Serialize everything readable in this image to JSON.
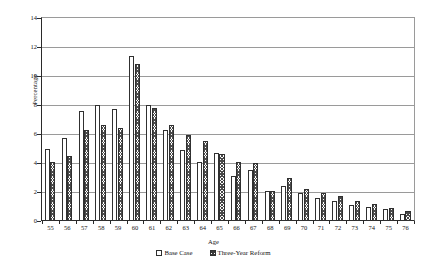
{
  "chart_data": {
    "type": "bar",
    "title": "",
    "xlabel": "Age",
    "ylabel": "Percentage",
    "ylim": [
      0,
      14
    ],
    "ytick_step": 2,
    "yticks": [
      0,
      2,
      4,
      6,
      8,
      10,
      12,
      14
    ],
    "grid": true,
    "legend_position": "bottom-center",
    "categories": [
      "55",
      "56",
      "57",
      "58",
      "59",
      "60",
      "61",
      "62",
      "63",
      "64",
      "65",
      "66",
      "67",
      "68",
      "69",
      "70",
      "71",
      "72",
      "73",
      "74",
      "75",
      "76"
    ],
    "series": [
      {
        "name": "Base Case",
        "values": [
          5.0,
          5.7,
          7.6,
          8.0,
          7.7,
          11.4,
          8.0,
          6.3,
          4.9,
          4.1,
          4.7,
          3.1,
          3.5,
          2.1,
          2.4,
          1.9,
          1.6,
          1.4,
          1.1,
          1.0,
          0.8,
          0.5
        ]
      },
      {
        "name": "Three-Year Reform",
        "values": [
          4.1,
          4.5,
          6.3,
          6.6,
          6.4,
          10.8,
          7.8,
          6.6,
          5.9,
          5.5,
          4.6,
          4.1,
          4.0,
          2.1,
          3.0,
          2.2,
          1.9,
          1.7,
          1.4,
          1.2,
          0.9,
          0.7
        ]
      }
    ]
  },
  "axes": {
    "y_title": "Percentage",
    "x_title": "Age",
    "y_labels": [
      "14",
      "12",
      "10",
      "8",
      "6",
      "4",
      "2",
      "0"
    ]
  },
  "legend": {
    "items": [
      {
        "label": "Base Case",
        "swatch": "open-square-swatch"
      },
      {
        "label": "Three-Year Reform",
        "swatch": "hatched-square-swatch"
      }
    ]
  },
  "colors": {
    "axis": "#2a2a2a",
    "gridline": "#9a9a9a",
    "bar_outline": "#303030",
    "base_fill": "#ffffff",
    "reform_hatch": "#4a4a4a",
    "background": "#ffffff"
  }
}
